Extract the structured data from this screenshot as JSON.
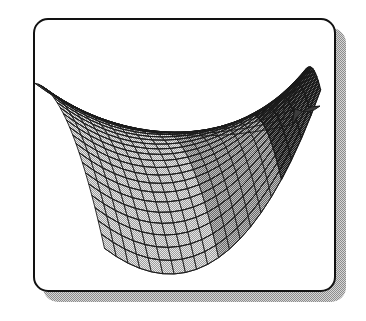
{
  "document": {
    "type": "scanned-figure",
    "background_color": "#ffffff",
    "width": 366,
    "height": 321,
    "caption": ""
  },
  "frame": {
    "name": "rounded-rectangle-border",
    "x": 33,
    "y": 18,
    "width": 303,
    "height": 274,
    "corner_radius": 15,
    "border_width": 2.5,
    "border_color": "#121212",
    "fill_color": "#ffffff"
  },
  "shadow": {
    "name": "drop-shadow",
    "offset_x": 10,
    "offset_y": 10,
    "fill_color": "#a9a9a9",
    "pattern": "dithered-halftone",
    "dark_color": "#8d8d8d",
    "light_color": "#d6d6d6"
  },
  "chart_data": {
    "type": "surface",
    "title": "",
    "subtitle": "",
    "xlabel": "",
    "ylabel": "",
    "zlabel": "",
    "render_style": "wireframe-mesh-shaded",
    "surface_name": "saddle-surface",
    "surface_family": "hyperbolic-paraboloid",
    "grid": false,
    "axes_visible": false,
    "legend": null,
    "tick_labels": [],
    "annotations": [],
    "mesh": {
      "u_divisions": 20,
      "v_divisions": 22,
      "u_range": [
        -1,
        1
      ],
      "v_range": [
        -1,
        1
      ],
      "line_color": "#1a1a1a",
      "line_width": 0.9,
      "face_fill_light": "#d2d2d2",
      "face_fill_mid": "#9a9a9a",
      "face_fill_dark": "#3d3d3d",
      "shading": "depth-and-curvature"
    },
    "projection": {
      "type": "oblique-perspective",
      "origin_x": 186,
      "origin_y": 155,
      "scale_x": 116,
      "scale_y": 86,
      "tilt": 0.32,
      "twist": 0.46,
      "fold_strength": 0.72
    },
    "extent_px": {
      "left": 55,
      "right": 318,
      "top": 62,
      "bottom": 248
    },
    "features": [
      {
        "name": "upper-left-ridge",
        "description": "Concave-up ridge running along the top-left boundary of the surface",
        "px": [
          118,
          66
        ]
      },
      {
        "name": "left-corner",
        "description": "Leftmost corner of the mesh where the surface sweeps down",
        "px": [
          56,
          160
        ]
      },
      {
        "name": "lower-trough",
        "description": "Bottom trough of the saddle where mesh cells compress",
        "px": [
          186,
          243
        ]
      },
      {
        "name": "right-fold",
        "description": "Dark folded region where the surface turns edge-on",
        "px": [
          268,
          190
        ]
      },
      {
        "name": "fin-tip",
        "description": "Sharp dark spike extending to the upper right",
        "px": [
          318,
          104
        ]
      }
    ]
  }
}
